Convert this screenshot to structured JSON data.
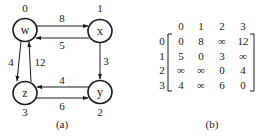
{
  "graph": {
    "caption": "(a)",
    "nodes": [
      {
        "id": "w",
        "label": "w",
        "index": "0",
        "cx": 25,
        "cy": 30,
        "ix": 25,
        "iy": 14
      },
      {
        "id": "x",
        "label": "x",
        "index": "1",
        "cx": 100,
        "cy": 31,
        "ix": 100,
        "iy": 14
      },
      {
        "id": "y",
        "label": "y",
        "index": "2",
        "cx": 100,
        "cy": 92,
        "ix": 100,
        "iy": 114
      },
      {
        "id": "z",
        "label": "z",
        "index": "3",
        "cx": 25,
        "cy": 93,
        "ix": 25,
        "iy": 114
      }
    ],
    "edges": [
      {
        "from": "w",
        "to": "x",
        "weight": "8"
      },
      {
        "from": "x",
        "to": "w",
        "weight": "5"
      },
      {
        "from": "x",
        "to": "y",
        "weight": "3"
      },
      {
        "from": "y",
        "to": "z",
        "weight": "4"
      },
      {
        "from": "z",
        "to": "y",
        "weight": "6"
      },
      {
        "from": "w",
        "to": "z",
        "weight": "4"
      },
      {
        "from": "z",
        "to": "w",
        "weight": "12"
      }
    ]
  },
  "matrix": {
    "caption": "(b)",
    "col_headers": [
      "0",
      "1",
      "2",
      "3"
    ],
    "row_headers": [
      "0",
      "1",
      "2",
      "3"
    ],
    "rows": [
      [
        "0",
        "8",
        "∞",
        "12"
      ],
      [
        "5",
        "0",
        "3",
        "∞"
      ],
      [
        "∞",
        "∞",
        "0",
        "4"
      ],
      [
        "4",
        "∞",
        "6",
        "0"
      ]
    ]
  },
  "colors": {
    "stroke": "#1a1a1a",
    "background": "#ffffff"
  }
}
